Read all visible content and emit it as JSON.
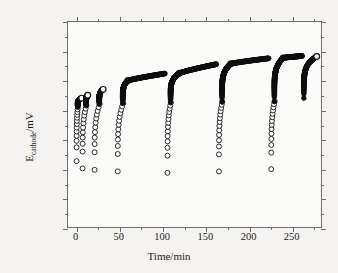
{
  "figure": {
    "background_color": "#f4f3f1",
    "plot_background_color": "#fbfbfa",
    "frame_color": "#6d6d6d"
  },
  "axes": {
    "x_title": "Time/min",
    "y_title_main": "E",
    "y_title_sub": "cathode",
    "y_title_unit": "/mV",
    "x_ticks": [
      "0",
      "50",
      "100",
      "150",
      "200",
      "250"
    ],
    "y_ticks": [
      "0",
      "−200",
      "−400",
      "−600",
      "−800",
      "−1000",
      "−1200",
      "−1400"
    ]
  },
  "chart_data": {
    "type": "scatter",
    "title": "",
    "xlabel": "Time/min",
    "ylabel": "E_cathode/mV",
    "xlim": [
      -10,
      285
    ],
    "ylim": [
      0,
      -1400
    ],
    "y_inverted": true,
    "grid": false,
    "legend": null,
    "x_tick_values": [
      0,
      50,
      100,
      150,
      200,
      250
    ],
    "x_minor_tick_values": [
      25,
      75,
      125,
      175,
      225,
      275
    ],
    "y_tick_values": [
      0,
      -200,
      -400,
      -600,
      -800,
      -1000,
      -1200,
      -1400
    ],
    "y_minor_tick_values": [
      -100,
      -300,
      -500,
      -700,
      -900,
      -1100,
      -1300
    ],
    "marker_style": "open-circle",
    "marker_edge_color": "#111111",
    "marker_face_color": "#ffffff",
    "series": [
      {
        "name": "run-1",
        "t_start": 0,
        "t_end": 6,
        "v_start": -450,
        "v_knee": -820,
        "v_end": -880,
        "n_sparse": 13,
        "sparse_spread_t": 1.5
      },
      {
        "name": "run-2",
        "t_start": 7,
        "t_end": 13,
        "v_start": -400,
        "v_knee": -830,
        "v_end": -900,
        "n_sparse": 12,
        "sparse_spread_t": 4.5
      },
      {
        "name": "run-3",
        "t_start": 21,
        "t_end": 31,
        "v_start": -390,
        "v_knee": -840,
        "v_end": -940,
        "n_sparse": 12,
        "sparse_spread_t": 6.0
      },
      {
        "name": "run-4",
        "t_start": 48,
        "t_end": 60,
        "v_start": -380,
        "v_knee": -845,
        "v_end": -1000,
        "n_sparse": 13,
        "sparse_spread_t": 6.5
      },
      {
        "name": "run-5",
        "t_start": 106,
        "t_end": 120,
        "v_start": -370,
        "v_knee": -850,
        "v_end": -1050,
        "n_sparse": 14,
        "sparse_spread_t": 4.0
      },
      {
        "name": "run-6",
        "t_start": 166,
        "t_end": 180,
        "v_start": -380,
        "v_knee": -855,
        "v_end": -1115,
        "n_sparse": 14,
        "sparse_spread_t": 4.0
      },
      {
        "name": "run-7",
        "t_start": 227,
        "t_end": 241,
        "v_start": -395,
        "v_knee": -858,
        "v_end": -1155,
        "n_sparse": 14,
        "sparse_spread_t": 4.0
      },
      {
        "name": "run-8",
        "t_start": 265,
        "t_end": 280,
        "v_start": -860,
        "v_knee": -880,
        "v_end": -1165,
        "n_sparse": 0,
        "sparse_spread_t": 0
      }
    ],
    "branch_tails": [
      {
        "series": "run-4",
        "t_from": 60,
        "t_to": 103,
        "v_from": -1000,
        "v_to": -1048
      },
      {
        "series": "run-5",
        "t_from": 120,
        "t_to": 163,
        "v_from": -1050,
        "v_to": -1112
      },
      {
        "series": "run-6",
        "t_from": 180,
        "t_to": 224,
        "v_from": -1115,
        "v_to": -1152
      },
      {
        "series": "run-7",
        "t_from": 241,
        "t_to": 263,
        "v_from": -1155,
        "v_to": -1168
      }
    ]
  }
}
